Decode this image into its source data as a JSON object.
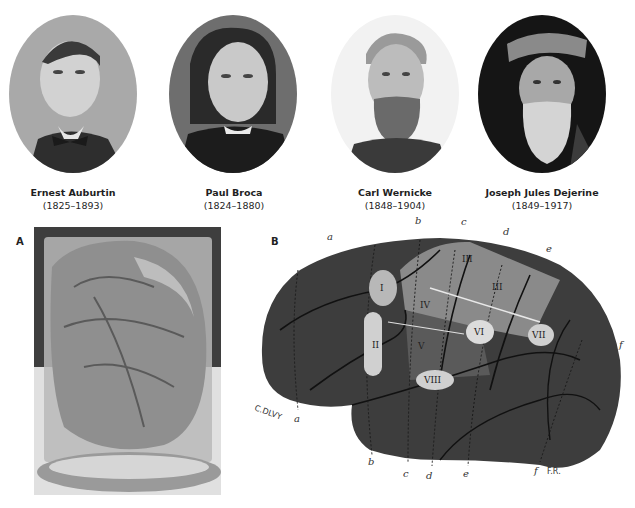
{
  "figure": {
    "portraits": [
      {
        "name": "Ernest Auburtin",
        "years": "(1825–1893)"
      },
      {
        "name": "Paul Broca",
        "years": "(1824–1880)"
      },
      {
        "name": "Carl Wernicke",
        "years": "(1848–1904)"
      },
      {
        "name": "Joseph Jules Dejerine",
        "years": "(1849–1917)"
      }
    ],
    "panel_a": {
      "label": "A",
      "description": "Preserved brain in glass jar"
    },
    "panel_b": {
      "label": "B",
      "description": "Lateral brain diagram with numbered regions",
      "top_labels": [
        "a",
        "b",
        "c",
        "d",
        "e"
      ],
      "right_label": "f",
      "bottom_labels": [
        "b",
        "c",
        "d",
        "e",
        "f"
      ],
      "left_label": "a",
      "signature": "C.DLVY",
      "corner_text": "F.R.",
      "regions": [
        "I",
        "II",
        "III",
        "III",
        "IV",
        "V",
        "VI",
        "VII",
        "VIII"
      ]
    },
    "colors": {
      "background": "#ffffff",
      "brain_dark": "#3a3a3a",
      "brain_light_band": "#8c8c8c",
      "region_fill": "#c8c8c8",
      "text": "#222222"
    }
  }
}
